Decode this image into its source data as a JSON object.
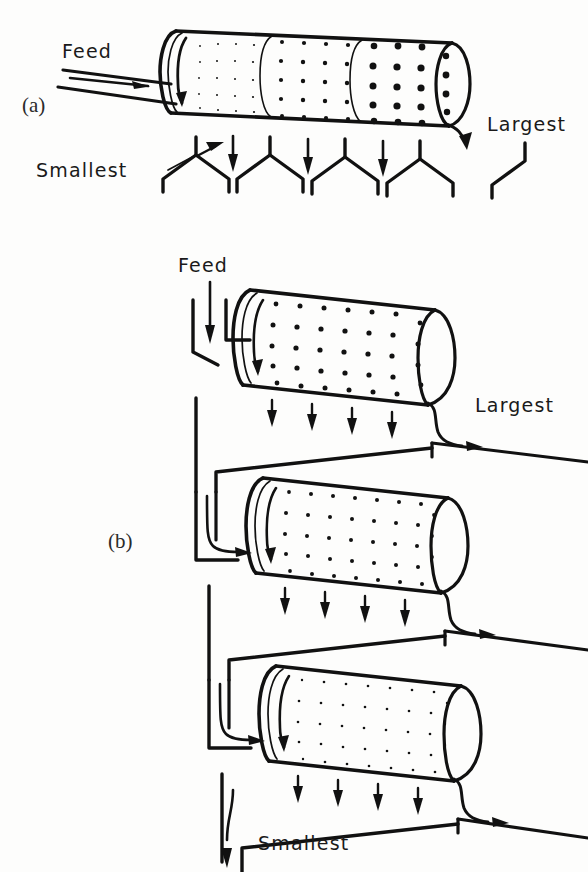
{
  "figure": {
    "panels": [
      {
        "id": "a",
        "panel_label": "(a)",
        "type": "compound-trommel-single-drum",
        "description": "Single rotating trommel with three screening sections of increasing aperture size discharging into separate collecting hoppers",
        "labels": {
          "feed": "Feed",
          "smallest": "Smallest",
          "largest": "Largest"
        },
        "sections": [
          {
            "index": 1,
            "aperture": "fine",
            "dot_radius": 1.0
          },
          {
            "index": 2,
            "aperture": "medium",
            "dot_radius": 2.2
          },
          {
            "index": 3,
            "aperture": "coarse",
            "dot_radius": 3.6
          }
        ],
        "hopper_count": 3,
        "undersize_arrows": 3
      },
      {
        "id": "b",
        "panel_label": "(b)",
        "type": "trommels-in-series",
        "description": "Three trommel screens arranged in series, each successive drum having a finer screen, oversize discharged at each stage",
        "labels": {
          "feed": "Feed",
          "largest": "Largest",
          "smallest": "Smallest"
        },
        "stages": [
          {
            "index": 1,
            "aperture": "coarse",
            "dot_radius": 2.6,
            "oversize_label": "Largest"
          },
          {
            "index": 2,
            "aperture": "medium",
            "dot_radius": 2.0,
            "oversize_label": ""
          },
          {
            "index": 3,
            "aperture": "fine",
            "dot_radius": 1.3,
            "oversize_label": ""
          }
        ],
        "undersize_arrows_per_stage": 4
      }
    ],
    "colors": {
      "ink": "#111111",
      "paper": "#fdfdfc"
    }
  }
}
